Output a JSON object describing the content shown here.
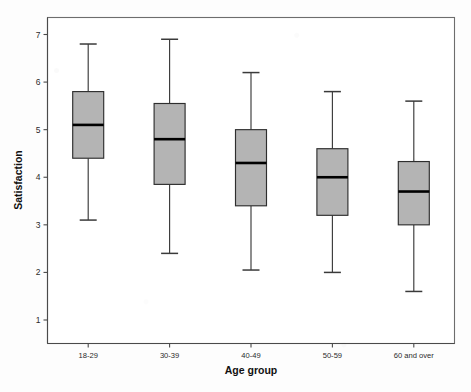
{
  "chart_data": {
    "type": "box",
    "title": "",
    "xlabel": "Age group",
    "ylabel": "Satisfaction",
    "categories": [
      "18-29",
      "30-39",
      "40-49",
      "50-59",
      "60 and over"
    ],
    "ylim": [
      0.6,
      7.35
    ],
    "yticks": [
      1,
      2,
      3,
      4,
      5,
      6,
      7
    ],
    "ytick_labels": [
      "1",
      "2",
      "3",
      "4",
      "5",
      "6",
      "7"
    ],
    "grid": false,
    "legend": false,
    "box_fill_color": "#b4b4b4",
    "box_edge_color": "#2e2e2e",
    "median_color": "#000000",
    "whisker_color": "#3a3a3a",
    "boxes": [
      {
        "category": "18-29",
        "whisker_low": 3.1,
        "q1": 4.4,
        "median": 5.1,
        "q3": 5.8,
        "whisker_high": 6.8
      },
      {
        "category": "30-39",
        "whisker_low": 2.4,
        "q1": 3.85,
        "median": 4.8,
        "q3": 5.55,
        "whisker_high": 6.9
      },
      {
        "category": "40-49",
        "whisker_low": 2.05,
        "q1": 3.4,
        "median": 4.3,
        "q3": 5.0,
        "whisker_high": 6.2
      },
      {
        "category": "50-59",
        "whisker_low": 2.0,
        "q1": 3.2,
        "median": 4.0,
        "q3": 4.6,
        "whisker_high": 5.8
      },
      {
        "category": "60 and over",
        "whisker_low": 1.6,
        "q1": 3.0,
        "median": 3.7,
        "q3": 4.33,
        "whisker_high": 5.6
      }
    ]
  }
}
